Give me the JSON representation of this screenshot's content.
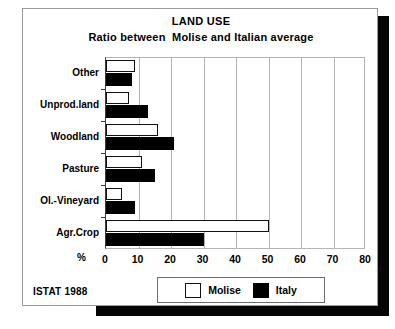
{
  "chart_data": {
    "type": "bar",
    "orientation": "horizontal",
    "title": "LAND USE",
    "subtitle": "Ratio between  Molise and Italian average",
    "xlabel": "%",
    "ylabel": "",
    "xlim": [
      0,
      80
    ],
    "xticks": [
      0,
      10,
      20,
      30,
      40,
      50,
      60,
      70,
      80
    ],
    "grid": true,
    "legend_position": "bottom-center",
    "categories": [
      "Other",
      "Unprod.land",
      "Woodland",
      "Pasture",
      "Ol.-Vineyard",
      "Agr.Crop"
    ],
    "series": [
      {
        "name": "Molise",
        "color": "#ffffff",
        "values": [
          9,
          7,
          16,
          11,
          5,
          50
        ]
      },
      {
        "name": "Italy",
        "color": "#000000",
        "values": [
          8,
          13,
          21,
          15,
          9,
          30
        ]
      }
    ],
    "source": "ISTAT 1988"
  },
  "legend": {
    "items": [
      {
        "label": "Molise",
        "swatch": "open-square-icon"
      },
      {
        "label": "Italy",
        "swatch": "filled-square-icon"
      }
    ]
  }
}
